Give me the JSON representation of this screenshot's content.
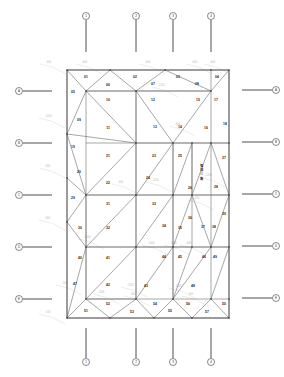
{
  "drawing": {
    "title": "Triangulated panel layout plan",
    "outline": {
      "x1": 67,
      "y1": 70,
      "x2": 229,
      "y2": 318
    },
    "top_axes": [
      {
        "label": "1",
        "x": 86
      },
      {
        "label": "2",
        "x": 136
      },
      {
        "label": "3",
        "x": 173
      },
      {
        "label": "4",
        "x": 211
      }
    ],
    "bottom_axes": [
      {
        "label": "1",
        "x": 86
      },
      {
        "label": "2",
        "x": 136
      },
      {
        "label": "3",
        "x": 173
      },
      {
        "label": "4",
        "x": 211
      }
    ],
    "left_axes": [
      {
        "label": "A",
        "y": 91
      },
      {
        "label": "B",
        "y": 143
      },
      {
        "label": "C",
        "y": 195
      },
      {
        "label": "D",
        "y": 247
      },
      {
        "label": "E",
        "y": 299
      }
    ],
    "right_axes": [
      {
        "label": "A",
        "y": 90
      },
      {
        "label": "B",
        "y": 142
      },
      {
        "label": "C",
        "y": 194
      },
      {
        "label": "D",
        "y": 246
      },
      {
        "label": "E",
        "y": 298
      }
    ],
    "panels": [
      {
        "id": "01",
        "x": 86,
        "y": 77
      },
      {
        "id": "02",
        "x": 135,
        "y": 77
      },
      {
        "id": "03",
        "x": 178,
        "y": 77
      },
      {
        "id": "04",
        "x": 217,
        "y": 77
      },
      {
        "id": "05",
        "x": 73,
        "y": 92
      },
      {
        "id": "06",
        "x": 108,
        "y": 85
      },
      {
        "id": "07",
        "x": 153,
        "y": 84
      },
      {
        "id": "08",
        "x": 197,
        "y": 84
      },
      {
        "id": "09",
        "x": 79,
        "y": 120
      },
      {
        "id": "10",
        "x": 108,
        "y": 100
      },
      {
        "id": "11",
        "x": 108,
        "y": 128
      },
      {
        "id": "12",
        "x": 153,
        "y": 100
      },
      {
        "id": "13",
        "x": 155,
        "y": 127
      },
      {
        "id": "14",
        "x": 180,
        "y": 127
      },
      {
        "id": "15",
        "x": 198,
        "y": 100
      },
      {
        "id": "16",
        "x": 206,
        "y": 128
      },
      {
        "id": "17",
        "x": 216,
        "y": 100
      },
      {
        "id": "18",
        "x": 225,
        "y": 124
      },
      {
        "id": "19",
        "x": 73,
        "y": 147
      },
      {
        "id": "20",
        "x": 79,
        "y": 172
      },
      {
        "id": "21",
        "x": 108,
        "y": 156
      },
      {
        "id": "22",
        "x": 108,
        "y": 183
      },
      {
        "id": "23",
        "x": 154,
        "y": 156
      },
      {
        "id": "24",
        "x": 148,
        "y": 178
      },
      {
        "id": "25",
        "x": 180,
        "y": 156
      },
      {
        "id": "26",
        "x": 190,
        "y": 188
      },
      {
        "id": "27",
        "x": 224,
        "y": 158
      },
      {
        "id": "28",
        "x": 216,
        "y": 187
      },
      {
        "id": "29",
        "x": 73,
        "y": 198
      },
      {
        "id": "30",
        "x": 80,
        "y": 228
      },
      {
        "id": "31",
        "x": 108,
        "y": 204
      },
      {
        "id": "32",
        "x": 108,
        "y": 228
      },
      {
        "id": "33",
        "x": 154,
        "y": 204
      },
      {
        "id": "34",
        "x": 164,
        "y": 226
      },
      {
        "id": "35",
        "x": 180,
        "y": 228
      },
      {
        "id": "36",
        "x": 190,
        "y": 218
      },
      {
        "id": "37",
        "x": 203,
        "y": 227
      },
      {
        "id": "38",
        "x": 214,
        "y": 227
      },
      {
        "id": "39",
        "x": 224,
        "y": 214
      },
      {
        "id": "40",
        "x": 80,
        "y": 258
      },
      {
        "id": "41",
        "x": 108,
        "y": 258
      },
      {
        "id": "42",
        "x": 108,
        "y": 285
      },
      {
        "id": "43",
        "x": 146,
        "y": 286
      },
      {
        "id": "44",
        "x": 164,
        "y": 257
      },
      {
        "id": "45",
        "x": 180,
        "y": 257
      },
      {
        "id": "46",
        "x": 204,
        "y": 257
      },
      {
        "id": "47",
        "x": 75,
        "y": 284
      },
      {
        "id": "48",
        "x": 193,
        "y": 286
      },
      {
        "id": "49",
        "x": 215,
        "y": 257
      },
      {
        "id": "50",
        "x": 224,
        "y": 304
      },
      {
        "id": "51",
        "x": 86,
        "y": 311
      },
      {
        "id": "52",
        "x": 108,
        "y": 304
      },
      {
        "id": "53",
        "x": 132,
        "y": 312
      },
      {
        "id": "54",
        "x": 155,
        "y": 304
      },
      {
        "id": "55",
        "x": 170,
        "y": 311
      },
      {
        "id": "56",
        "x": 188,
        "y": 304
      },
      {
        "id": "57",
        "x": 207,
        "y": 312
      }
    ],
    "vertical_note": {
      "text": "弧顶三角",
      "x": 201,
      "y": 166
    },
    "dimensions": [
      {
        "text": "-600",
        "x": 46,
        "y": 63
      },
      {
        "text": "-600",
        "x": 82,
        "y": 63
      },
      {
        "text": "-600",
        "x": 145,
        "y": 63
      },
      {
        "text": "-600",
        "x": 192,
        "y": 63
      },
      {
        "text": "-600",
        "x": 210,
        "y": 63
      },
      {
        "text": "-1100",
        "x": 158,
        "y": 86
      },
      {
        "text": "-1000",
        "x": 45,
        "y": 117
      },
      {
        "text": "-600",
        "x": 45,
        "y": 167
      },
      {
        "text": "-600",
        "x": 45,
        "y": 219
      },
      {
        "text": "-100",
        "x": 45,
        "y": 313
      },
      {
        "text": "-600",
        "x": 175,
        "y": 125
      },
      {
        "text": "-600",
        "x": 118,
        "y": 183
      },
      {
        "text": "-1200",
        "x": 152,
        "y": 181
      },
      {
        "text": "-1200",
        "x": 205,
        "y": 176
      },
      {
        "text": "-600",
        "x": 194,
        "y": 199
      },
      {
        "text": "-1450",
        "x": 148,
        "y": 244
      },
      {
        "text": "-1450",
        "x": 170,
        "y": 244
      },
      {
        "text": "-600",
        "x": 186,
        "y": 244
      },
      {
        "text": "-1200",
        "x": 127,
        "y": 286
      },
      {
        "text": "-1200",
        "x": 175,
        "y": 287
      },
      {
        "text": "-1000",
        "x": 84,
        "y": 238
      },
      {
        "text": "-100",
        "x": 62,
        "y": 284
      },
      {
        "text": "-600",
        "x": 99,
        "y": 293
      },
      {
        "text": "-300",
        "x": 188,
        "y": 295
      },
      {
        "text": "-300",
        "x": 130,
        "y": 295
      }
    ]
  }
}
